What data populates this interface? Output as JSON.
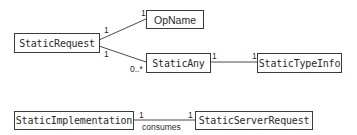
{
  "diagram": {
    "type": "uml-class-diagram",
    "classes": [
      {
        "id": "static_request",
        "name": "StaticRequest"
      },
      {
        "id": "op_name",
        "name": "OpName"
      },
      {
        "id": "static_any",
        "name": "StaticAny"
      },
      {
        "id": "static_type_info",
        "name": "StaticTypeInfo"
      },
      {
        "id": "static_implementation",
        "name": "StaticImplementation"
      },
      {
        "id": "static_server_request",
        "name": "StaticServerRequest"
      }
    ],
    "associations": [
      {
        "from": "StaticRequest",
        "to": "OpName",
        "from_mult": "1",
        "to_mult": "1",
        "label": ""
      },
      {
        "from": "StaticRequest",
        "to": "StaticAny",
        "from_mult": "1",
        "to_mult": "0..*",
        "label": ""
      },
      {
        "from": "StaticAny",
        "to": "StaticTypeInfo",
        "from_mult": "1",
        "to_mult": "1",
        "label": ""
      },
      {
        "from": "StaticImplementation",
        "to": "StaticServerRequest",
        "from_mult": "1",
        "to_mult": "1",
        "label": "consumes"
      }
    ]
  },
  "colors": {
    "line": "#4a4a4a",
    "border": "#3a3a3a",
    "text": "#2a2a2a",
    "background": "#ffffff"
  }
}
